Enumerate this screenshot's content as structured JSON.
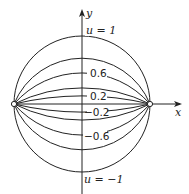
{
  "diagram": {
    "type": "bipolar-coordinate-level-curves",
    "axes": {
      "x_label": "x",
      "y_label": "y"
    },
    "foci": [
      {
        "x": 14,
        "y": 104
      },
      {
        "x": 150,
        "y": 104
      }
    ],
    "curves": [
      {
        "u": "1",
        "label": "u = 1",
        "apex_y": 37
      },
      {
        "u": "0.8",
        "label": "",
        "apex_y": 57
      },
      {
        "u": "0.6",
        "label": "0.6",
        "apex_y": 73
      },
      {
        "u": "0.4",
        "label": "",
        "apex_y": 87
      },
      {
        "u": "0.2",
        "label": "0.2",
        "apex_y": 96
      },
      {
        "u": "0",
        "label": "",
        "apex_y": 104
      },
      {
        "u": "-0.2",
        "label": "−0.2",
        "apex_y": 112
      },
      {
        "u": "-0.4",
        "label": "",
        "apex_y": 121
      },
      {
        "u": "-0.6",
        "label": "−0.6",
        "apex_y": 135
      },
      {
        "u": "-0.8",
        "label": "",
        "apex_y": 151
      },
      {
        "u": "-1",
        "label": "u = −1",
        "apex_y": 171
      }
    ],
    "labels": {
      "top": "u = 1",
      "l06": "0.6",
      "l02": "0.2",
      "lm02": "−0.2",
      "lm06": "−0.6",
      "bottom": "u = −1"
    },
    "colors": {
      "stroke": "#222222",
      "background": "#ffffff"
    }
  }
}
